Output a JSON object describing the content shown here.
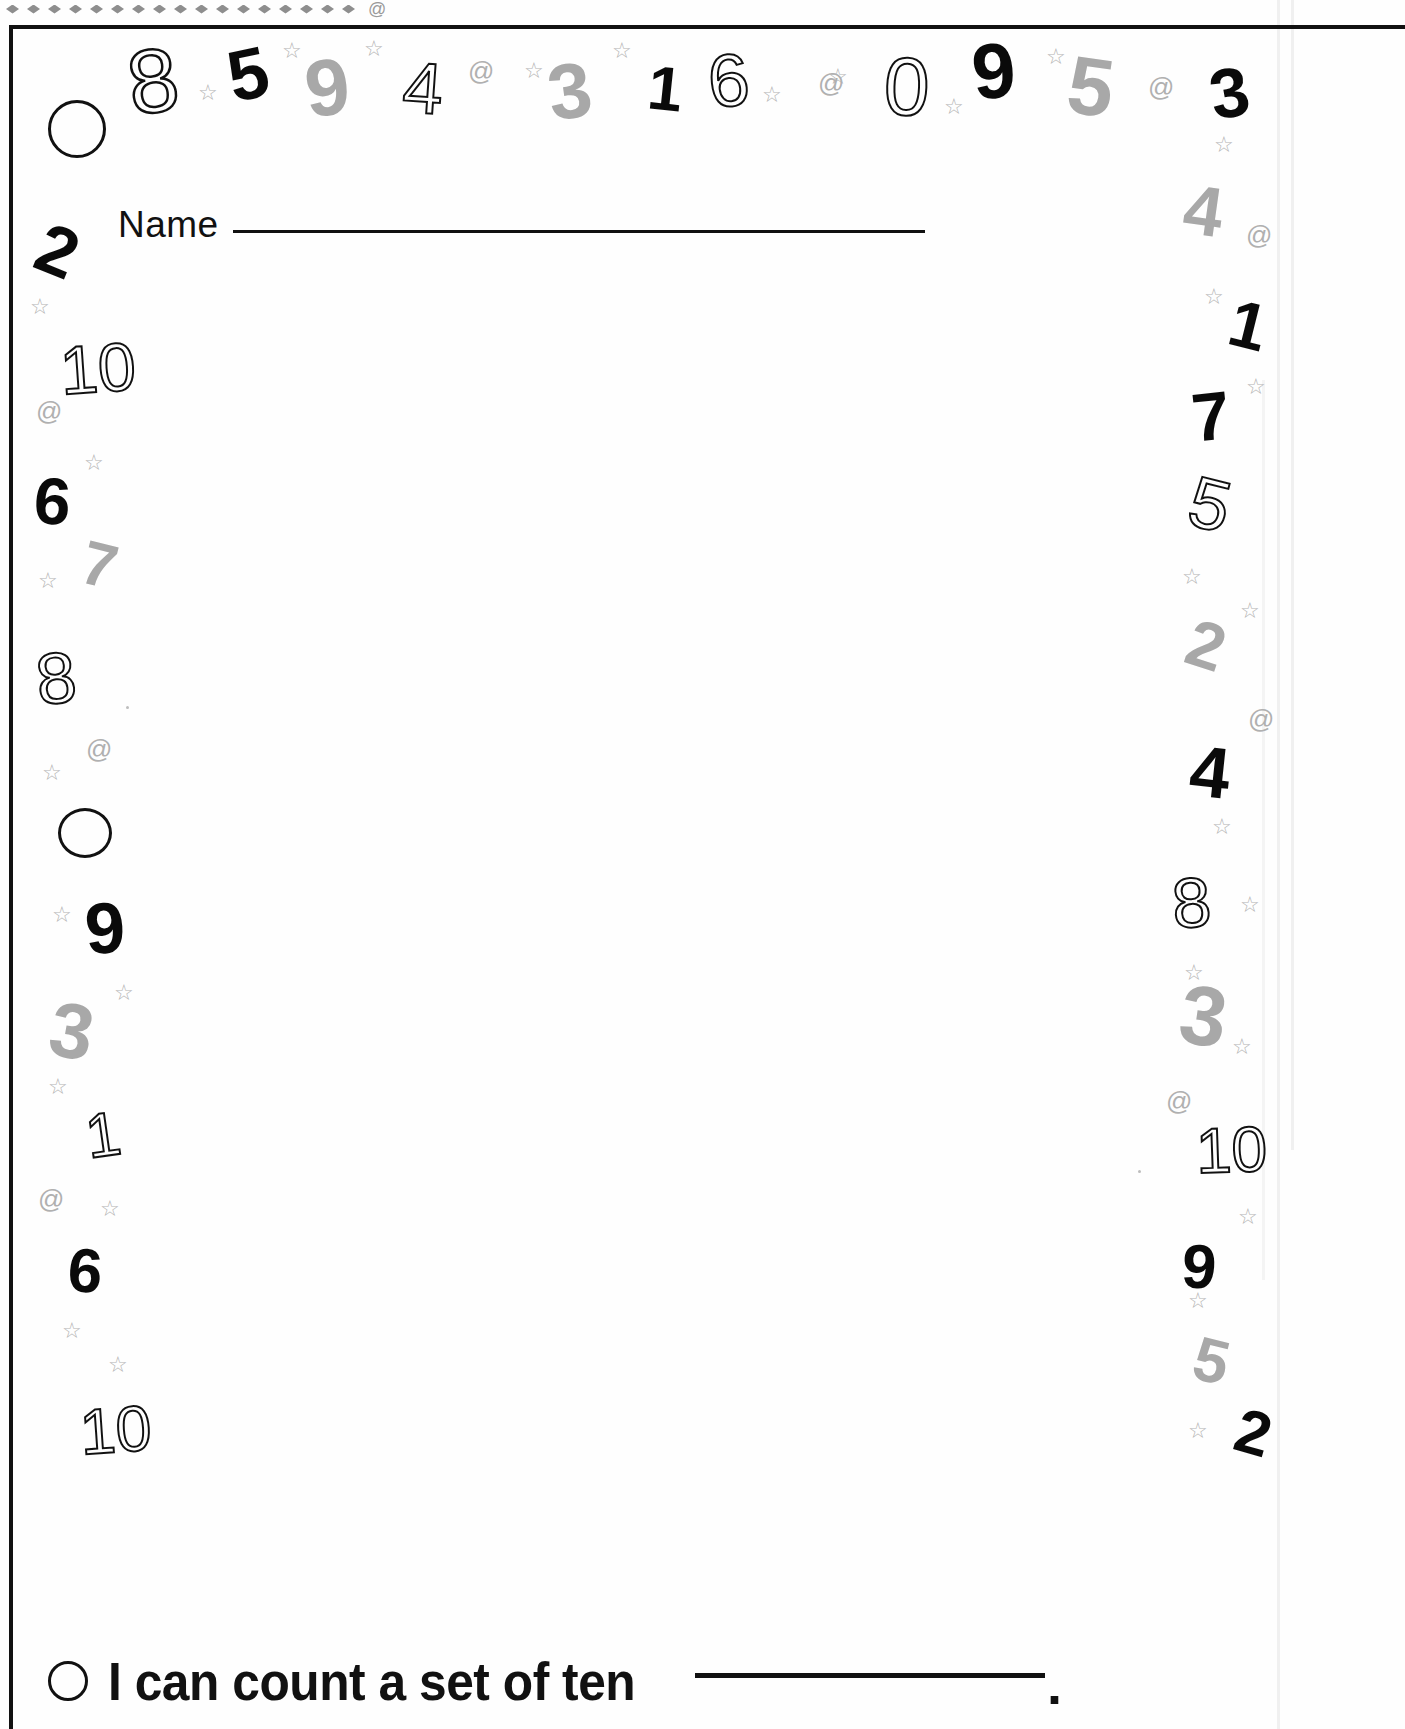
{
  "worksheet": {
    "name_label": "Name",
    "statement": "I can count a set of ten",
    "statement_period": ".",
    "bullet_icon": "circle-outline"
  },
  "top_band": {
    "diamond_count": 17,
    "spiral_glyph": "@",
    "diamond_color": "#8e8e8e"
  },
  "colors": {
    "ink": "#111111",
    "gray_number": "#a8a8a8",
    "star": "#b4b4b4",
    "spiral": "#b0b0b0",
    "paper": "#fefefe"
  },
  "decor": {
    "top_row_numbers": [
      "0",
      "8",
      "5",
      "9",
      "4",
      "3",
      "1",
      "6",
      "0",
      "9",
      "5",
      "3"
    ],
    "left_column_numbers": [
      "2",
      "10",
      "6",
      "7",
      "8",
      "0",
      "9",
      "3",
      "1",
      "6",
      "10"
    ],
    "right_column_numbers": [
      "4",
      "1",
      "7",
      "5",
      "2",
      "4",
      "8",
      "3",
      "10",
      "9",
      "5",
      "2"
    ],
    "glyphs": [
      {
        "t": "0",
        "x": 48,
        "y": 100,
        "size": 62,
        "style": "circle",
        "rot": 0,
        "w": 52,
        "h": 52
      },
      {
        "t": "8",
        "x": 128,
        "y": 36,
        "size": 90,
        "style": "outline",
        "rot": -8
      },
      {
        "t": "5",
        "x": 228,
        "y": 38,
        "size": 72,
        "style": "solid",
        "rot": -12
      },
      {
        "t": "9",
        "x": 305,
        "y": 48,
        "size": 80,
        "style": "gray",
        "rot": -6
      },
      {
        "t": "4",
        "x": 403,
        "y": 52,
        "size": 72,
        "style": "outline-thin",
        "rot": 4
      },
      {
        "t": "3",
        "x": 548,
        "y": 52,
        "size": 78,
        "style": "gray",
        "rot": -8
      },
      {
        "t": "1",
        "x": 648,
        "y": 58,
        "size": 62,
        "style": "solid",
        "rot": 6
      },
      {
        "t": "6",
        "x": 708,
        "y": 44,
        "size": 74,
        "style": "outline-thin",
        "rot": -6
      },
      {
        "t": "0",
        "x": 884,
        "y": 46,
        "size": 82,
        "style": "outline-thin",
        "rot": 2
      },
      {
        "t": "9",
        "x": 972,
        "y": 32,
        "size": 78,
        "style": "solid",
        "rot": -6
      },
      {
        "t": "5",
        "x": 1068,
        "y": 46,
        "size": 82,
        "style": "gray",
        "rot": 8
      },
      {
        "t": "3",
        "x": 1210,
        "y": 58,
        "size": 70,
        "style": "solid",
        "rot": -10
      },
      {
        "t": "2",
        "x": 38,
        "y": 216,
        "size": 70,
        "style": "solid",
        "rot": 22
      },
      {
        "t": "10",
        "x": 60,
        "y": 334,
        "size": 68,
        "style": "outline-thin",
        "rot": -4
      },
      {
        "t": "6",
        "x": 34,
        "y": 468,
        "size": 66,
        "style": "solid",
        "rot": 4
      },
      {
        "t": "7",
        "x": 82,
        "y": 534,
        "size": 62,
        "style": "gray",
        "rot": 14
      },
      {
        "t": "8",
        "x": 36,
        "y": 642,
        "size": 72,
        "style": "outline-thin",
        "rot": -6
      },
      {
        "t": "0",
        "x": 58,
        "y": 808,
        "size": 62,
        "style": "circle",
        "rot": 0,
        "w": 48,
        "h": 44
      },
      {
        "t": "9",
        "x": 85,
        "y": 892,
        "size": 72,
        "style": "solid",
        "rot": -4
      },
      {
        "t": "3",
        "x": 50,
        "y": 992,
        "size": 78,
        "style": "gray",
        "rot": 10
      },
      {
        "t": "1",
        "x": 86,
        "y": 1104,
        "size": 62,
        "style": "outline-thin",
        "rot": -8
      },
      {
        "t": "6",
        "x": 68,
        "y": 1240,
        "size": 62,
        "style": "solid",
        "rot": 4
      },
      {
        "t": "10",
        "x": 80,
        "y": 1398,
        "size": 64,
        "style": "outline-thin",
        "rot": -4
      },
      {
        "t": "4",
        "x": 1184,
        "y": 176,
        "size": 70,
        "style": "gray",
        "rot": 8
      },
      {
        "t": "1",
        "x": 1230,
        "y": 292,
        "size": 66,
        "style": "solid",
        "rot": 14
      },
      {
        "t": "7",
        "x": 1192,
        "y": 382,
        "size": 68,
        "style": "solid",
        "rot": -6
      },
      {
        "t": "5",
        "x": 1190,
        "y": 468,
        "size": 72,
        "style": "outline-thin",
        "rot": 14
      },
      {
        "t": "2",
        "x": 1188,
        "y": 612,
        "size": 66,
        "style": "gray",
        "rot": 18
      },
      {
        "t": "4",
        "x": 1190,
        "y": 736,
        "size": 72,
        "style": "solid",
        "rot": 6
      },
      {
        "t": "8",
        "x": 1172,
        "y": 868,
        "size": 70,
        "style": "outline-thin",
        "rot": -4
      },
      {
        "t": "3",
        "x": 1180,
        "y": 974,
        "size": 84,
        "style": "gray",
        "rot": 8
      },
      {
        "t": "10",
        "x": 1196,
        "y": 1118,
        "size": 64,
        "style": "outline-thin",
        "rot": -2
      },
      {
        "t": "9",
        "x": 1182,
        "y": 1236,
        "size": 62,
        "style": "solid",
        "rot": 4
      },
      {
        "t": "5",
        "x": 1194,
        "y": 1330,
        "size": 62,
        "style": "gray",
        "rot": 14
      },
      {
        "t": "2",
        "x": 1236,
        "y": 1402,
        "size": 62,
        "style": "solid",
        "rot": 16
      }
    ],
    "stars": [
      {
        "x": 198,
        "y": 82
      },
      {
        "x": 282,
        "y": 40
      },
      {
        "x": 364,
        "y": 38
      },
      {
        "x": 524,
        "y": 60
      },
      {
        "x": 612,
        "y": 40
      },
      {
        "x": 762,
        "y": 84
      },
      {
        "x": 828,
        "y": 66
      },
      {
        "x": 944,
        "y": 96
      },
      {
        "x": 1046,
        "y": 46
      },
      {
        "x": 1214,
        "y": 134
      },
      {
        "x": 30,
        "y": 296
      },
      {
        "x": 84,
        "y": 452
      },
      {
        "x": 38,
        "y": 570
      },
      {
        "x": 42,
        "y": 762
      },
      {
        "x": 52,
        "y": 904
      },
      {
        "x": 114,
        "y": 982
      },
      {
        "x": 48,
        "y": 1076
      },
      {
        "x": 100,
        "y": 1198
      },
      {
        "x": 62,
        "y": 1320
      },
      {
        "x": 108,
        "y": 1354
      },
      {
        "x": 1204,
        "y": 286
      },
      {
        "x": 1246,
        "y": 376
      },
      {
        "x": 1182,
        "y": 566
      },
      {
        "x": 1240,
        "y": 600
      },
      {
        "x": 1212,
        "y": 816
      },
      {
        "x": 1240,
        "y": 894
      },
      {
        "x": 1184,
        "y": 962
      },
      {
        "x": 1232,
        "y": 1036
      },
      {
        "x": 1238,
        "y": 1206
      },
      {
        "x": 1188,
        "y": 1290
      },
      {
        "x": 1188,
        "y": 1420
      }
    ],
    "spirals": [
      {
        "x": 468,
        "y": 58
      },
      {
        "x": 818,
        "y": 70
      },
      {
        "x": 1148,
        "y": 74
      },
      {
        "x": 36,
        "y": 398
      },
      {
        "x": 86,
        "y": 736
      },
      {
        "x": 38,
        "y": 1186
      },
      {
        "x": 1246,
        "y": 222
      },
      {
        "x": 1248,
        "y": 706
      },
      {
        "x": 1166,
        "y": 1088
      }
    ],
    "specks": [
      {
        "x": 126,
        "y": 706
      },
      {
        "x": 1138,
        "y": 1170
      }
    ]
  }
}
